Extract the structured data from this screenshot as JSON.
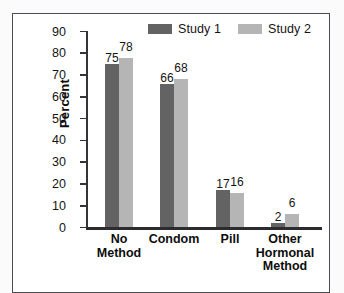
{
  "chart_data": {
    "type": "bar",
    "title": "",
    "subtitle": "",
    "xlabel": "",
    "ylabel": "Percent",
    "ylim": [
      0,
      90
    ],
    "ytick_values": [
      90,
      80,
      70,
      60,
      50,
      40,
      30,
      20,
      10,
      0
    ],
    "ytick_labels": [
      "90",
      "80",
      "70",
      "60",
      "50",
      "40",
      "30",
      "20",
      "10",
      "0"
    ],
    "grid": false,
    "legend_position": "top-right",
    "categories": [
      "No Method",
      "Condom",
      "Pill",
      "Other Hormonal Method"
    ],
    "category_lines": [
      [
        "No",
        "Method"
      ],
      [
        "Condom"
      ],
      [
        "Pill"
      ],
      [
        "Other",
        "Hormonal",
        "Method"
      ]
    ],
    "series": [
      {
        "name": "Study 1",
        "color": "#636363",
        "values": [
          75,
          66,
          17,
          2
        ]
      },
      {
        "name": "Study 2",
        "color": "#b5b5b5",
        "values": [
          78,
          68,
          16,
          6
        ]
      }
    ],
    "value_labels": [
      [
        "75",
        "78"
      ],
      [
        "66",
        "68"
      ],
      [
        "17",
        "16"
      ],
      [
        "2",
        "6"
      ]
    ]
  },
  "colors": {
    "series_1": "#636363",
    "series_2": "#b5b5b5",
    "axis": "#2b2b30",
    "frame": "#4c4c54",
    "text": "#141414",
    "background": "#fbfbfb",
    "plot_background": "#ffffff"
  },
  "legend": {
    "entries": [
      {
        "label": "Study 1",
        "swatch_name": "legend-swatch-study-1"
      },
      {
        "label": "Study 2",
        "swatch_name": "legend-swatch-study-2"
      }
    ]
  }
}
